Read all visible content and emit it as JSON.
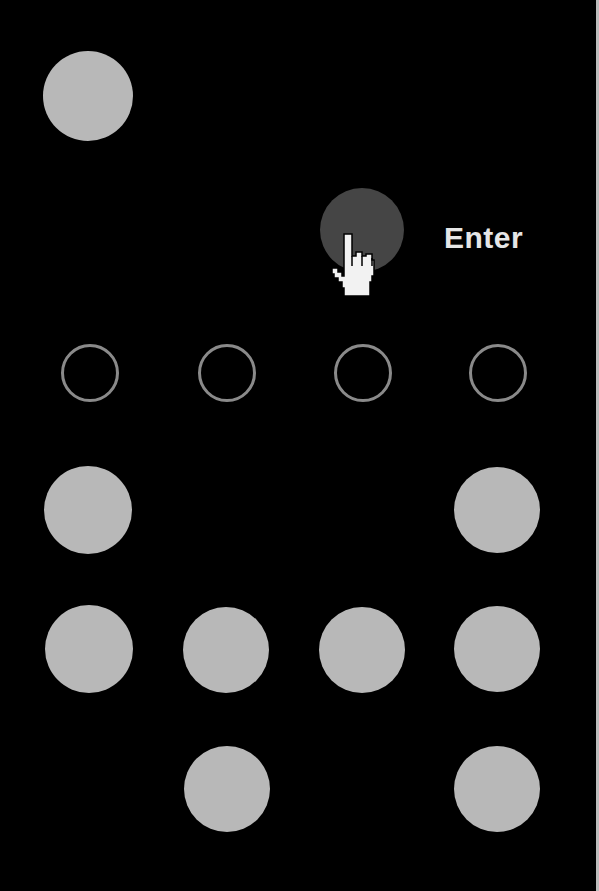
{
  "screen": {
    "background": "#000000",
    "enter_label": "Enter"
  },
  "pin_indicators": {
    "count": 4,
    "filled": 0,
    "color": "#8a8a8a"
  },
  "keypad": {
    "key_color": "#b8b8b8",
    "active_key_color": "#454545",
    "keys": [
      {
        "id": "key-top-left",
        "x": 88,
        "y": 96,
        "r": 45,
        "active": false
      },
      {
        "id": "key-enter-adjacent",
        "x": 362,
        "y": 230,
        "r": 42,
        "active": true
      },
      {
        "id": "key-r4-c1",
        "x": 88,
        "y": 510,
        "r": 44,
        "active": false
      },
      {
        "id": "key-r4-c4",
        "x": 497,
        "y": 510,
        "r": 43,
        "active": false
      },
      {
        "id": "key-r5-c1",
        "x": 89,
        "y": 649,
        "r": 44,
        "active": false
      },
      {
        "id": "key-r5-c2",
        "x": 226,
        "y": 650,
        "r": 43,
        "active": false
      },
      {
        "id": "key-r5-c3",
        "x": 362,
        "y": 650,
        "r": 43,
        "active": false
      },
      {
        "id": "key-r5-c4",
        "x": 497,
        "y": 649,
        "r": 43,
        "active": false
      },
      {
        "id": "key-r6-c2",
        "x": 227,
        "y": 789,
        "r": 43,
        "active": false
      },
      {
        "id": "key-r6-c4",
        "x": 497,
        "y": 789,
        "r": 43,
        "active": false
      }
    ]
  },
  "cursor": {
    "icon": "hand-pointer-icon"
  }
}
